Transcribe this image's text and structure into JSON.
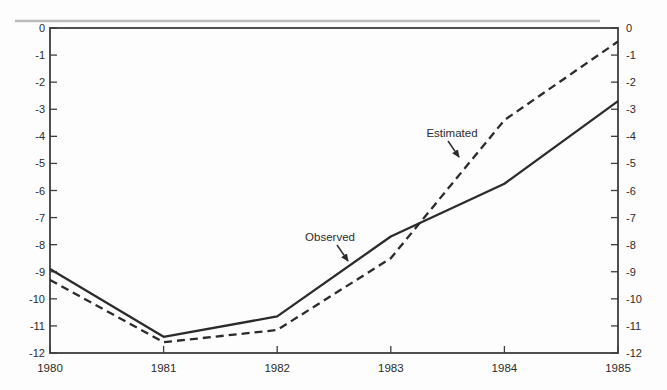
{
  "chart_data": {
    "type": "line",
    "title": "",
    "xlabel": "",
    "ylabel": "",
    "x": [
      1980,
      1981,
      1982,
      1983,
      1984,
      1985
    ],
    "x_tick_labels": [
      "1980",
      "1981",
      "1982",
      "1983",
      "1984",
      "1985"
    ],
    "y_ticks": [
      0,
      -1,
      -2,
      -3,
      -4,
      -5,
      -6,
      -7,
      -8,
      -9,
      -10,
      -11,
      -12
    ],
    "y_tick_labels": [
      "0",
      "-1",
      "-2",
      "-3",
      "-4",
      "-5",
      "-6",
      "-7",
      "-8",
      "-9",
      "-10",
      "-11",
      "-12"
    ],
    "ylim": [
      -12,
      0
    ],
    "grid": false,
    "legend_position": "inline-annotations",
    "dual_y_axis": true,
    "series": [
      {
        "name": "Observed",
        "line_style": "solid",
        "values": [
          -8.9,
          -11.4,
          -10.65,
          -7.7,
          -5.75,
          -2.7
        ]
      },
      {
        "name": "Estimated",
        "line_style": "dashed",
        "values": [
          -9.3,
          -11.6,
          -11.15,
          -8.5,
          -3.4,
          -0.5
        ]
      }
    ],
    "annotations": [
      {
        "text": "Observed",
        "label_x": 330,
        "label_y": 241,
        "arrow": [
          337,
          245,
          348,
          261
        ]
      },
      {
        "text": "Estimated",
        "label_x": 452,
        "label_y": 137,
        "arrow": [
          448,
          141,
          459,
          157
        ]
      }
    ],
    "colors": {
      "line": "#2b2b2b",
      "axis": "#3d3d3d",
      "text": "#2b2b2b",
      "scan_artifact": "#b0b0b0"
    },
    "frame": {
      "left": 50,
      "right": 618,
      "top": 28,
      "bottom": 353
    }
  }
}
